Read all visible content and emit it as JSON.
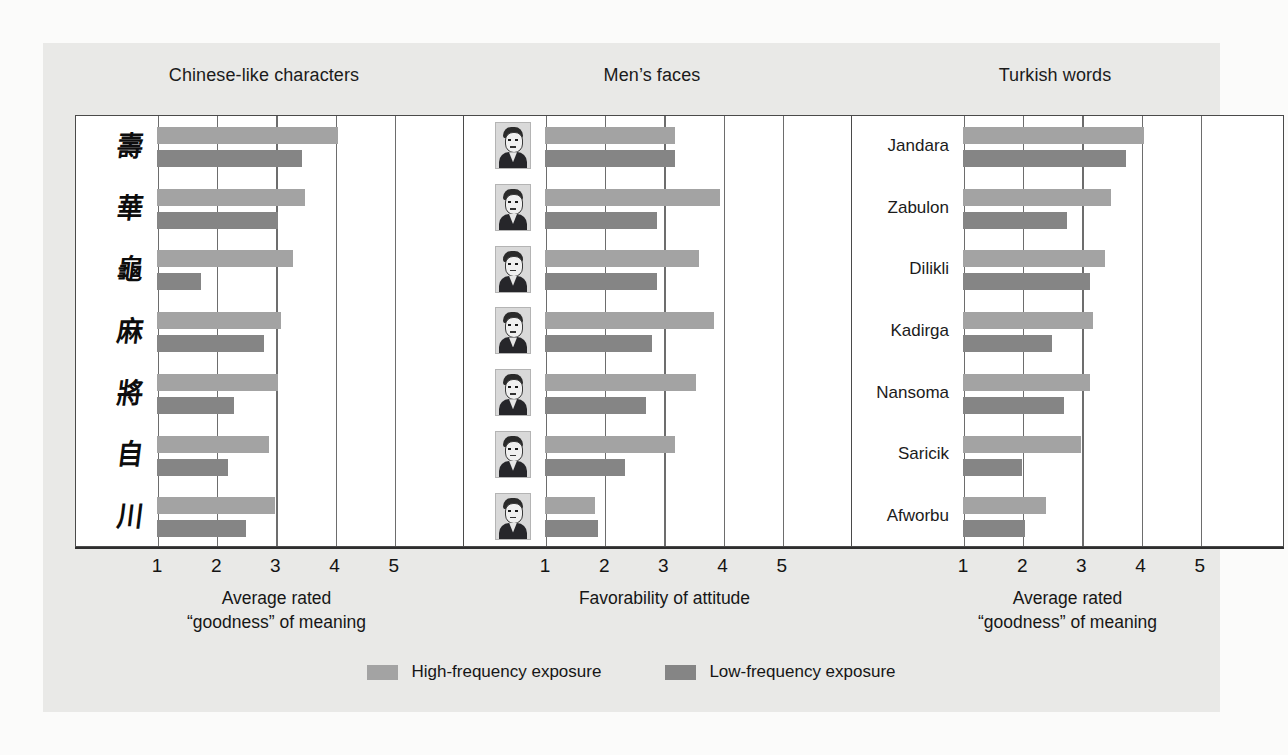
{
  "figure": {
    "background_color": "#e9e9e7",
    "bar_color_high": "#a3a3a3",
    "bar_color_low": "#858585"
  },
  "legend": {
    "items": [
      {
        "label": "High-frequency exposure",
        "color": "#a3a3a3",
        "key": "high"
      },
      {
        "label": "Low-frequency exposure",
        "color": "#858585",
        "key": "low"
      }
    ]
  },
  "panels": [
    {
      "title": "Chinese-like characters",
      "axis_title_line1": "Average rated",
      "axis_title_line2": "“goodness” of meaning",
      "label_type": "glyph",
      "ticks": [
        "1",
        "2",
        "3",
        "4",
        "5"
      ],
      "rows": [
        {
          "label": "壽",
          "high": 4.05,
          "low": 3.45
        },
        {
          "label": "華",
          "high": 3.5,
          "low": 3.05
        },
        {
          "label": "龜",
          "high": 3.3,
          "low": 1.75
        },
        {
          "label": "麻",
          "high": 3.1,
          "low": 2.8
        },
        {
          "label": "將",
          "high": 3.05,
          "low": 2.3
        },
        {
          "label": "自",
          "high": 2.9,
          "low": 2.2
        },
        {
          "label": "川",
          "high": 3.0,
          "low": 2.5
        }
      ]
    },
    {
      "title": "Men’s faces",
      "axis_title_line1": "Favorability of attitude",
      "axis_title_line2": "",
      "label_type": "face",
      "ticks": [
        "1",
        "2",
        "3",
        "4",
        "5"
      ],
      "rows": [
        {
          "label": "face-1",
          "high": 3.2,
          "low": 3.2
        },
        {
          "label": "face-2",
          "high": 3.95,
          "low": 2.9
        },
        {
          "label": "face-3",
          "high": 3.6,
          "low": 2.9
        },
        {
          "label": "face-4",
          "high": 3.85,
          "low": 2.8
        },
        {
          "label": "face-5",
          "high": 3.55,
          "low": 2.7
        },
        {
          "label": "face-6",
          "high": 3.2,
          "low": 2.35
        },
        {
          "label": "face-7",
          "high": 1.85,
          "low": 1.9
        }
      ]
    },
    {
      "title": "Turkish words",
      "axis_title_line1": "Average rated",
      "axis_title_line2": "“goodness” of meaning",
      "label_type": "text",
      "ticks": [
        "1",
        "2",
        "3",
        "4",
        "5"
      ],
      "rows": [
        {
          "label": "Jandara",
          "high": 4.05,
          "low": 3.75
        },
        {
          "label": "Zabulon",
          "high": 3.5,
          "low": 2.75
        },
        {
          "label": "Dilikli",
          "high": 3.4,
          "low": 3.15
        },
        {
          "label": "Kadirga",
          "high": 3.2,
          "low": 2.5
        },
        {
          "label": "Nansoma",
          "high": 3.15,
          "low": 2.7
        },
        {
          "label": "Saricik",
          "high": 3.0,
          "low": 2.0
        },
        {
          "label": "Afworbu",
          "high": 2.4,
          "low": 2.05
        }
      ]
    }
  ],
  "chart_data": {
    "type": "bar",
    "orientation": "horizontal",
    "title": "",
    "grid": true,
    "legend_position": "bottom",
    "xlim": [
      0,
      5
    ],
    "xticks": [
      1,
      2,
      3,
      4,
      5
    ],
    "panels": [
      {
        "title": "Chinese-like characters",
        "xlabel": "Average rated “goodness” of meaning",
        "categories": [
          "char-1",
          "char-2",
          "char-3",
          "char-4",
          "char-5",
          "char-6",
          "char-7"
        ],
        "series": [
          {
            "name": "High-frequency exposure",
            "values": [
              4.05,
              3.5,
              3.3,
              3.1,
              3.05,
              2.9,
              3.0
            ]
          },
          {
            "name": "Low-frequency exposure",
            "values": [
              3.45,
              3.05,
              1.75,
              2.8,
              2.3,
              2.2,
              2.5
            ]
          }
        ]
      },
      {
        "title": "Men’s faces",
        "xlabel": "Favorability of attitude",
        "categories": [
          "face-1",
          "face-2",
          "face-3",
          "face-4",
          "face-5",
          "face-6",
          "face-7"
        ],
        "series": [
          {
            "name": "High-frequency exposure",
            "values": [
              3.2,
              3.95,
              3.6,
              3.85,
              3.55,
              3.2,
              1.85
            ]
          },
          {
            "name": "Low-frequency exposure",
            "values": [
              3.2,
              2.9,
              2.9,
              2.8,
              2.7,
              2.35,
              1.9
            ]
          }
        ]
      },
      {
        "title": "Turkish words",
        "xlabel": "Average rated “goodness” of meaning",
        "categories": [
          "Jandara",
          "Zabulon",
          "Dilikli",
          "Kadirga",
          "Nansoma",
          "Saricik",
          "Afworbu"
        ],
        "series": [
          {
            "name": "High-frequency exposure",
            "values": [
              4.05,
              3.5,
              3.4,
              3.2,
              3.15,
              3.0,
              2.4
            ]
          },
          {
            "name": "Low-frequency exposure",
            "values": [
              3.75,
              2.75,
              3.15,
              2.5,
              2.7,
              2.0,
              2.05
            ]
          }
        ]
      }
    ]
  }
}
